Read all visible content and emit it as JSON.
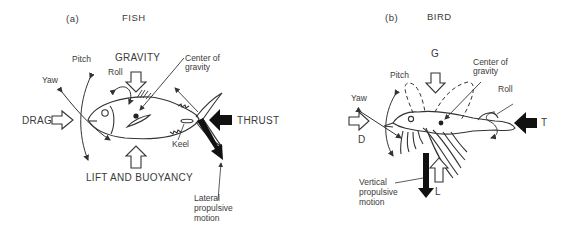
{
  "panels": {
    "fish": {
      "letter": "(a)",
      "title": "FISH",
      "labels": {
        "gravity": "GRAVITY",
        "pitch": "Pitch",
        "yaw": "Yaw",
        "roll": "Roll",
        "center_of_gravity": "Center of\ngravity",
        "drag": "DRAG",
        "thrust": "THRUST",
        "keel": "Keel",
        "lift": "LIFT AND BUOYANCY",
        "lateral": "Lateral\npropulsive\nmotion"
      }
    },
    "bird": {
      "letter": "(b)",
      "title": "BIRD",
      "labels": {
        "gravity": "G",
        "pitch": "Pitch",
        "yaw": "Yaw",
        "roll": "Roll",
        "center_of_gravity": "Center of\ngravity",
        "drag": "D",
        "thrust": "T",
        "lift": "L",
        "vertical": "Vertical\npropulsive\nmotion"
      }
    }
  },
  "colors": {
    "line": "#333333",
    "text": "#3a3a3a",
    "background": "#ffffff"
  }
}
